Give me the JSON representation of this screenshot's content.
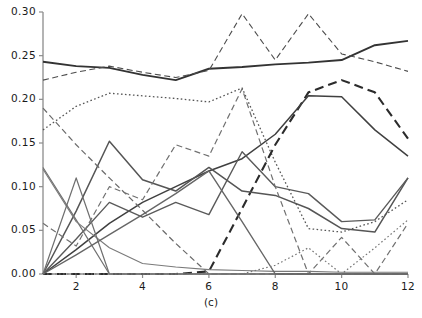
{
  "chart_data": {
    "type": "line",
    "title": "",
    "subtitle": "",
    "caption": "(c)",
    "xlabel": "",
    "ylabel": "",
    "xlim": [
      1,
      12
    ],
    "ylim": [
      0.0,
      0.3
    ],
    "grid": false,
    "legend": "none",
    "x": [
      1,
      2,
      3,
      4,
      5,
      6,
      7,
      8,
      9,
      10,
      11,
      12
    ],
    "ytick_labels": [
      "0.00",
      "0.05",
      "0.10",
      "0.15",
      "0.20",
      "0.25",
      "0.30"
    ],
    "ytick_values": [
      0.0,
      0.05,
      0.1,
      0.15,
      0.2,
      0.25,
      0.3
    ],
    "xtick_labels": [
      "2",
      "4",
      "6",
      "8",
      "10",
      "12"
    ],
    "xtick_values": [
      2,
      4,
      6,
      8,
      10,
      12
    ],
    "series": [
      {
        "name": "series-1-solid-thick-upper",
        "style": "solid",
        "width": 1.9,
        "color": "#333333",
        "values": [
          0.243,
          0.238,
          0.236,
          0.228,
          0.222,
          0.235,
          0.237,
          0.24,
          0.242,
          0.245,
          0.262,
          0.267
        ]
      },
      {
        "name": "series-2-dashed-thin-upper",
        "style": "dashed",
        "width": 1.1,
        "color": "#4d4d4d",
        "values": [
          0.222,
          0.231,
          0.238,
          0.231,
          0.225,
          0.233,
          0.298,
          0.245,
          0.298,
          0.252,
          0.243,
          0.232
        ]
      },
      {
        "name": "series-3-dotted-upper",
        "style": "dotted",
        "width": 1.3,
        "color": "#555555",
        "values": [
          0.165,
          0.192,
          0.207,
          0.204,
          0.201,
          0.197,
          0.213,
          0.128,
          0.052,
          0.048,
          0.06,
          0.085
        ]
      },
      {
        "name": "series-4-dashed-thick-rising",
        "style": "dashed-thick",
        "width": 2.1,
        "color": "#2b2b2b",
        "values": [
          0.0,
          0.0,
          0.0,
          0.0,
          0.0,
          0.003,
          0.075,
          0.148,
          0.208,
          0.222,
          0.208,
          0.155
        ]
      },
      {
        "name": "series-5-solid-mid-rising",
        "style": "solid",
        "width": 1.5,
        "color": "#404040",
        "values": [
          0.0,
          0.028,
          0.058,
          0.082,
          0.1,
          0.118,
          0.132,
          0.16,
          0.204,
          0.203,
          0.165,
          0.135
        ]
      },
      {
        "name": "series-6-solid-peak3",
        "style": "solid",
        "width": 1.5,
        "color": "#555555",
        "values": [
          0.0,
          0.072,
          0.152,
          0.108,
          0.095,
          0.122,
          0.095,
          0.09,
          0.075,
          0.052,
          0.048,
          0.11
        ]
      },
      {
        "name": "series-7-solid-wavy-low",
        "style": "solid",
        "width": 1.4,
        "color": "#5a5a5a",
        "values": [
          0.0,
          0.04,
          0.082,
          0.065,
          0.082,
          0.068,
          0.14,
          0.1,
          0.092,
          0.06,
          0.062,
          0.11
        ]
      },
      {
        "name": "series-8-dashed-descend-from-left",
        "style": "dashed",
        "width": 1.2,
        "color": "#6a6a6a",
        "values": [
          0.19,
          0.148,
          0.11,
          0.073,
          0.035,
          0.0,
          0.0,
          0.0,
          0.0,
          0.0,
          0.0,
          0.0
        ]
      },
      {
        "name": "series-9-dashed-zigzag-low",
        "style": "dashed",
        "width": 1.2,
        "color": "#707070",
        "values": [
          0.058,
          0.032,
          0.1,
          0.085,
          0.148,
          0.135,
          0.212,
          0.1,
          0.0,
          0.042,
          0.0,
          0.058
        ]
      },
      {
        "name": "series-10-solid-steep-drop",
        "style": "solid",
        "width": 1.2,
        "color": "#707070",
        "values": [
          0.122,
          0.062,
          0.0,
          0.0,
          0.0,
          0.0,
          0.0,
          0.0,
          0.0,
          0.0,
          0.0,
          0.0
        ]
      },
      {
        "name": "series-11-solid-thin-to-zero",
        "style": "solid",
        "width": 1.1,
        "color": "#7a7a7a",
        "values": [
          0.12,
          0.06,
          0.03,
          0.012,
          0.008,
          0.005,
          0.004,
          0.003,
          0.003,
          0.002,
          0.002,
          0.002
        ]
      },
      {
        "name": "series-12-solid-spike-x2",
        "style": "solid",
        "width": 1.2,
        "color": "#6f6f6f",
        "values": [
          0.0,
          0.11,
          0.0,
          0.0,
          0.0,
          0.0,
          0.0,
          0.0,
          0.0,
          0.0,
          0.0,
          0.0
        ]
      },
      {
        "name": "series-13-solid-rise-to-x6",
        "style": "solid",
        "width": 1.4,
        "color": "#666666",
        "values": [
          0.0,
          0.022,
          0.045,
          0.068,
          0.092,
          0.118,
          0.06,
          0.0,
          0.0,
          0.0,
          0.0,
          0.0
        ]
      },
      {
        "name": "series-14-dotted-low-right",
        "style": "dotted",
        "width": 1.2,
        "color": "#767676",
        "values": [
          0.0,
          0.0,
          0.0,
          0.0,
          0.0,
          0.0,
          0.0,
          0.01,
          0.03,
          0.0,
          0.03,
          0.062
        ]
      }
    ]
  },
  "axes": {
    "x_left_px": 43,
    "x_right_px": 408,
    "y_top_px": 12,
    "y_bottom_px": 274
  }
}
